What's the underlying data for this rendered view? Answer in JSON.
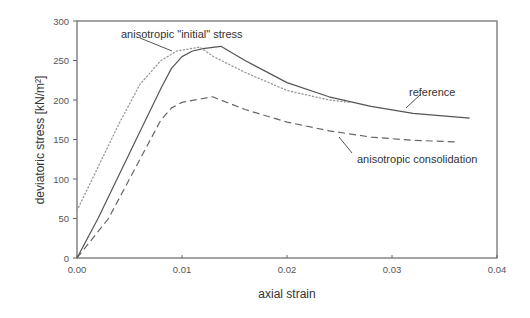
{
  "chart_data": {
    "type": "line",
    "title": "",
    "xlabel": "axial strain",
    "ylabel": "deviatoric stress [kN/m²]",
    "xlim": [
      0,
      0.04
    ],
    "ylim": [
      0,
      300
    ],
    "xticks": [
      "0.00",
      "0.01",
      "0.02",
      "0.03",
      "0.04"
    ],
    "xtick_values": [
      0,
      0.01,
      0.02,
      0.03,
      0.04
    ],
    "yticks": [
      "0",
      "50",
      "100",
      "150",
      "200",
      "250",
      "300"
    ],
    "ytick_values": [
      0,
      50,
      100,
      150,
      200,
      250,
      300
    ],
    "grid": false,
    "legend": "inline annotations",
    "series": [
      {
        "name": "reference",
        "style": "solid",
        "color": "#555555",
        "x": [
          0,
          0.002,
          0.004,
          0.006,
          0.008,
          0.009,
          0.01,
          0.011,
          0.012,
          0.0137,
          0.016,
          0.02,
          0.024,
          0.028,
          0.032,
          0.0374
        ],
        "y": [
          0,
          50,
          105,
          160,
          215,
          240,
          255,
          262,
          265,
          268,
          250,
          222,
          204,
          192,
          183,
          177
        ]
      },
      {
        "name": "anisotropic \"initial\" stress",
        "style": "dotted",
        "color": "#999999",
        "x": [
          0,
          0.002,
          0.004,
          0.006,
          0.008,
          0.0095,
          0.0117,
          0.013,
          0.016,
          0.02,
          0.024,
          0.026
        ],
        "y": [
          60,
          115,
          170,
          220,
          250,
          262,
          267,
          255,
          235,
          212,
          200,
          197
        ]
      },
      {
        "name": "anisotropic consolidation",
        "style": "dashed",
        "color": "#666666",
        "x": [
          0,
          0.003,
          0.005,
          0.007,
          0.008,
          0.009,
          0.01,
          0.0129,
          0.016,
          0.02,
          0.024,
          0.028,
          0.032,
          0.0363
        ],
        "y": [
          0,
          50,
          100,
          150,
          175,
          190,
          197,
          204,
          188,
          172,
          161,
          153,
          149,
          147
        ]
      }
    ],
    "annotations": [
      {
        "text": "anisotropic \"initial\" stress",
        "points_to": "dotted curve near peak",
        "text_x": 0.0097,
        "text_y": 285
      },
      {
        "text": "reference",
        "points_to": "solid curve",
        "text_x": 0.0315,
        "text_y": 210
      },
      {
        "text": "anisotropic consolidation",
        "points_to": "dashed curve",
        "text_x": 0.0272,
        "text_y": 133
      }
    ]
  }
}
